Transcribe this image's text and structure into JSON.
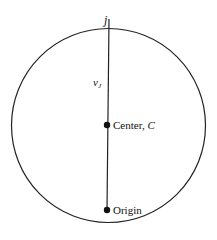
{
  "diagram": {
    "type": "circle-with-diameter-line",
    "circle": {
      "cx": 108.5,
      "cy": 125.5,
      "r": 97,
      "stroke": "#222222"
    },
    "line": {
      "x1": 109,
      "y1": 19,
      "x2": 107,
      "y2": 210,
      "stroke": "#222222"
    },
    "points": [
      {
        "id": "center",
        "label": "Center, ",
        "label_italic": "C",
        "x": 107,
        "y": 125
      },
      {
        "id": "origin",
        "label": "Origin",
        "x": 107,
        "y": 210
      }
    ],
    "labels": {
      "top_point": "j",
      "vector": "v",
      "vector_subscript": "J"
    }
  }
}
